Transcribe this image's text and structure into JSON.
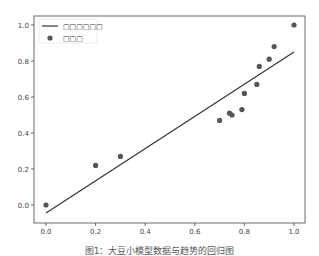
{
  "caption": "图1：大豆小模型数据与趋势的回归图",
  "legend": {
    "line_label": "□□□□□□",
    "points_label": "□□□"
  },
  "colors": {
    "line": "#333333",
    "points": "#555555",
    "frame": "#444444"
  },
  "chart_data": {
    "type": "scatter",
    "title": "",
    "xlabel": "",
    "ylabel": "",
    "xlim": [
      -0.05,
      1.05
    ],
    "ylim": [
      -0.1,
      1.05
    ],
    "xticks": [
      0.0,
      0.2,
      0.4,
      0.6,
      0.8,
      1.0
    ],
    "yticks": [
      0.0,
      0.2,
      0.4,
      0.6,
      0.8,
      1.0
    ],
    "xtick_labels": [
      "0.0",
      "0.2",
      "0.4",
      "0.6",
      "0.8",
      "1.0"
    ],
    "ytick_labels": [
      "0.0",
      "0.2",
      "0.4",
      "0.6",
      "0.8",
      "1.0"
    ],
    "grid": false,
    "legend_position": "upper left",
    "series": [
      {
        "name": "□□□",
        "kind": "scatter",
        "x": [
          0.0,
          0.2,
          0.3,
          0.7,
          0.74,
          0.75,
          0.79,
          0.8,
          0.85,
          0.86,
          0.9,
          0.92,
          1.0
        ],
        "y": [
          0.0,
          0.22,
          0.27,
          0.47,
          0.51,
          0.5,
          0.53,
          0.62,
          0.67,
          0.77,
          0.81,
          0.88,
          1.0
        ]
      },
      {
        "name": "□□□□□□",
        "kind": "line",
        "x": [
          0.0,
          1.0
        ],
        "y": [
          -0.045,
          0.85
        ]
      }
    ]
  }
}
